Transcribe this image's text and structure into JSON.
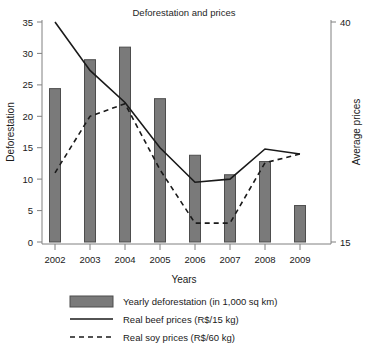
{
  "chart_data": {
    "type": "bar",
    "title": "Deforestation and prices",
    "xlabel": "Years",
    "ylabel": "Deforestation",
    "y2label": "Average prices",
    "categories": [
      "2002",
      "2003",
      "2004",
      "2005",
      "2006",
      "2007",
      "2008",
      "2009"
    ],
    "ylim": [
      0,
      35
    ],
    "yticks": [
      0,
      5,
      10,
      15,
      20,
      25,
      30,
      35
    ],
    "y2lim": [
      15,
      40
    ],
    "y2ticks": [
      15,
      40
    ],
    "grid": false,
    "legend_position": "bottom",
    "series": [
      {
        "name": "Yearly deforestation (in 1,000 sq km)",
        "type": "bar",
        "axis": "left",
        "color": "#7a7a7a",
        "values": [
          24.4,
          29.0,
          31.0,
          22.8,
          13.8,
          10.7,
          12.8,
          5.8
        ]
      },
      {
        "name": "Real beef prices (R$/15 kg)",
        "type": "line",
        "style": "solid",
        "axis": "right",
        "color": "#1a1a1a",
        "values_left_scale": [
          35.0,
          27.3,
          22.2,
          15.0,
          9.5,
          10.0,
          14.8,
          14.0
        ],
        "values": [
          40.0,
          34.5,
          30.9,
          25.7,
          21.8,
          22.1,
          25.6,
          25.0
        ]
      },
      {
        "name": "Real soy prices (R$/60 kg)",
        "type": "line",
        "style": "dashed",
        "axis": "right",
        "color": "#1a1a1a",
        "values_left_scale": [
          11.0,
          20.0,
          22.0,
          11.5,
          3.0,
          3.0,
          12.6,
          14.0
        ],
        "values": [
          22.9,
          29.3,
          30.7,
          23.2,
          17.1,
          17.1,
          24.0,
          25.0
        ]
      }
    ]
  },
  "axes": {
    "y_label": "Deforestation",
    "y2_label": "Average prices",
    "x_label": "Years",
    "y_ticks": [
      "0",
      "5",
      "10",
      "15",
      "20",
      "25",
      "30",
      "35"
    ],
    "y2_ticks": [
      "40",
      "15"
    ],
    "x_ticks": [
      "2002",
      "2003",
      "2004",
      "2005",
      "2006",
      "2007",
      "2008",
      "2009"
    ]
  },
  "title": "Deforestation and prices",
  "legend": {
    "items": [
      {
        "label": "Yearly deforestation (in 1,000 sq km)",
        "marker": "filled-rect"
      },
      {
        "label": "Real beef prices (R$/15 kg)",
        "marker": "solid-line"
      },
      {
        "label": "Real soy prices (R$/60 kg)",
        "marker": "dashed-line"
      }
    ]
  },
  "colors": {
    "bar_fill": "#7a7a7a",
    "bar_stroke": "#4d4d4d",
    "line": "#1a1a1a",
    "axis": "#808080",
    "background": "#ffffff"
  }
}
